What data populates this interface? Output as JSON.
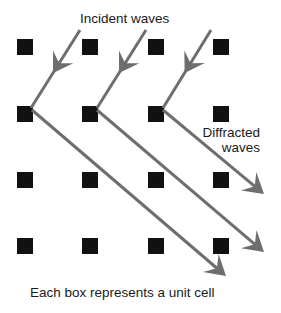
{
  "diagram": {
    "labels": {
      "incident": "Incident waves",
      "diffracted_line1": "Diffracted",
      "diffracted_line2": "waves",
      "caption": "Each box represents a unit cell"
    },
    "colors": {
      "box": "#111111",
      "wave": "#6e6e6e",
      "text": "#1a1a1a",
      "background": "#ffffff"
    },
    "lattice": {
      "columns_x": [
        17,
        82,
        148,
        213
      ],
      "rows_y": [
        39,
        106,
        172,
        238
      ],
      "box_size": 16
    },
    "incident_waves": [
      {
        "from": [
          80,
          30
        ],
        "to": [
          31,
          108
        ]
      },
      {
        "from": [
          146,
          30
        ],
        "to": [
          97,
          108
        ]
      },
      {
        "from": [
          211,
          30
        ],
        "to": [
          163,
          108
        ]
      }
    ],
    "diffracted_waves": [
      {
        "from": [
          32,
          110
        ],
        "to": [
          226,
          276
        ]
      },
      {
        "from": [
          97,
          110
        ],
        "to": [
          264,
          252
        ]
      },
      {
        "from": [
          163,
          110
        ],
        "to": [
          264,
          194
        ]
      }
    ]
  }
}
